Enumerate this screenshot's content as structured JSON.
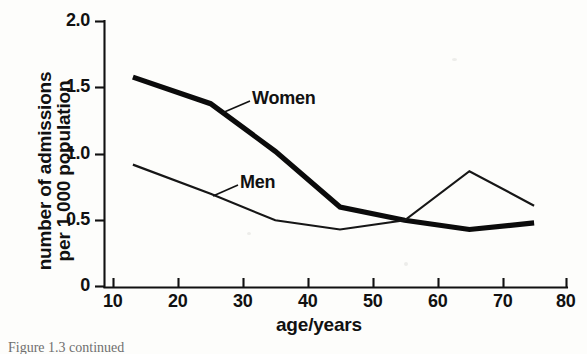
{
  "figure": {
    "background_color": "#fdfdfb",
    "ink_color": "#111111",
    "caption_partial": "Figure 1.3   continued"
  },
  "axes": {
    "x": {
      "title": "age/years",
      "ticks": [
        "10",
        "20",
        "30",
        "40",
        "50",
        "60",
        "70",
        "80"
      ],
      "min": 10,
      "max": 80
    },
    "y": {
      "title_line1": "number of admissions",
      "title_line2": "per 1 000 population",
      "ticks": [
        "0",
        "0.5",
        "1.0",
        "1.5",
        "2.0"
      ],
      "min": 0,
      "max": 2.0
    }
  },
  "annotations": {
    "women_label": "Women",
    "men_label": "Men"
  },
  "chart_data": {
    "type": "line",
    "title": "",
    "xlabel": "age/years",
    "ylabel": "number of admissions per 1 000 population",
    "xlim": [
      10,
      80
    ],
    "ylim": [
      0,
      2.0
    ],
    "xticks": [
      10,
      20,
      30,
      40,
      50,
      60,
      70,
      80
    ],
    "yticks": [
      0,
      0.5,
      1.0,
      1.5,
      2.0
    ],
    "grid": false,
    "legend": "inline-annotations",
    "x": [
      13,
      25,
      35,
      45,
      55,
      65,
      75
    ],
    "series": [
      {
        "name": "Women",
        "style": "thick",
        "values": [
          1.58,
          1.38,
          1.02,
          0.6,
          0.5,
          0.43,
          0.48
        ]
      },
      {
        "name": "Men",
        "style": "thin",
        "values": [
          0.92,
          0.7,
          0.5,
          0.43,
          0.5,
          0.87,
          0.61
        ]
      }
    ]
  }
}
